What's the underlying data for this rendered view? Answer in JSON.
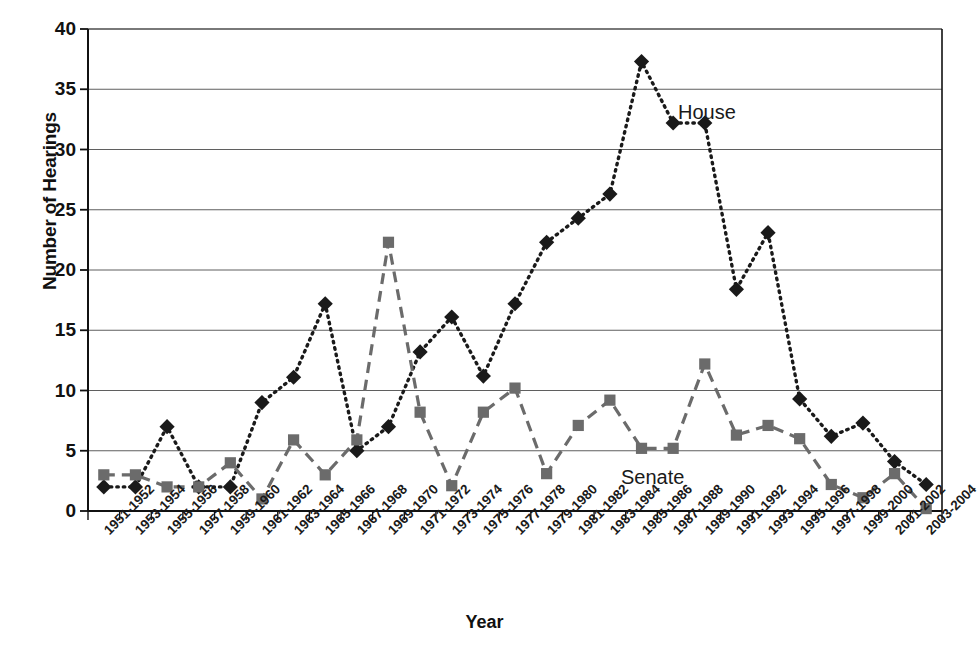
{
  "chart_data": {
    "type": "line",
    "title": "",
    "xlabel": "Year",
    "ylabel": "Number of Hearings",
    "ylim": [
      0,
      40
    ],
    "ytick_step": 5,
    "yticks": [
      0,
      5,
      10,
      15,
      20,
      25,
      30,
      35,
      40
    ],
    "grid": "horizontal",
    "legend_position": "inline-annotation",
    "categories": [
      "1951-1952",
      "1953-1954",
      "1955-1956",
      "1957-1958",
      "1959-1960",
      "1961-1962",
      "1963-1964",
      "1965-1966",
      "1967-1968",
      "1969-1970",
      "1971-1972",
      "1973-1974",
      "1975-1976",
      "1977-1978",
      "1979-1980",
      "1981-1982",
      "1983-1984",
      "1985-1986",
      "1987-1988",
      "1989-1990",
      "1991-1992",
      "1993-1994",
      "1995-1996",
      "1997-1998",
      "1999-2000",
      "2001-2002",
      "2003-2004"
    ],
    "series": [
      {
        "name": "House",
        "marker": "diamond",
        "line_style": "dotted",
        "color": "#1a1a1a",
        "values": [
          2.0,
          2.0,
          7.0,
          2.0,
          2.0,
          9.0,
          11.1,
          17.2,
          5.0,
          7.0,
          13.2,
          16.1,
          11.2,
          17.2,
          22.3,
          24.3,
          26.3,
          37.3,
          32.2,
          32.2,
          18.4,
          23.1,
          9.3,
          6.2,
          7.3,
          4.1,
          2.2
        ]
      },
      {
        "name": "Senate",
        "marker": "square",
        "line_style": "dashed",
        "color": "#6b6b6b",
        "values": [
          3.0,
          3.0,
          2.0,
          2.0,
          4.0,
          1.0,
          5.9,
          3.0,
          5.9,
          22.3,
          8.2,
          2.1,
          8.2,
          10.2,
          3.1,
          7.1,
          9.2,
          5.2,
          5.2,
          12.2,
          6.3,
          7.1,
          6.0,
          2.2,
          1.1,
          3.1,
          0.2
        ]
      }
    ],
    "annotations": [
      {
        "text": "House",
        "series": "House",
        "x_px": 678,
        "y_px": 101
      },
      {
        "text": "Senate",
        "series": "Senate",
        "x_px": 621,
        "y_px": 466
      }
    ]
  },
  "plot_geometry": {
    "left": 88,
    "right": 942,
    "top": 29,
    "bottom": 511
  }
}
